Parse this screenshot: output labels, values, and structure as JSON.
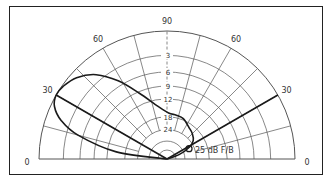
{
  "chart_data": {
    "type": "polar-elevation-pattern",
    "angle_labels": [
      {
        "angle": 0,
        "text": "0",
        "side": "left"
      },
      {
        "angle": 30,
        "text": "30",
        "side": "left"
      },
      {
        "angle": 60,
        "text": "60",
        "side": "left"
      },
      {
        "angle": 90,
        "text": "90",
        "side": "top"
      },
      {
        "angle": 60,
        "text": "60",
        "side": "right"
      },
      {
        "angle": 30,
        "text": "30",
        "side": "right"
      },
      {
        "angle": 0,
        "text": "0",
        "side": "right"
      }
    ],
    "radial_grid_angles_deg": [
      15,
      30,
      45,
      60,
      75,
      90,
      105,
      120,
      135,
      150,
      165
    ],
    "ring_labels": [
      {
        "db": -3,
        "text": "3"
      },
      {
        "db": -6,
        "text": "6"
      },
      {
        "db": -9,
        "text": "9"
      },
      {
        "db": -12,
        "text": "12"
      },
      {
        "db": -18,
        "text": "18"
      },
      {
        "db": -24,
        "text": "24"
      }
    ],
    "ring_radii_fraction": [
      1.0,
      0.81,
      0.68,
      0.57,
      0.47,
      0.33,
      0.23,
      0.14,
      0.07
    ],
    "annotation": "25 dB F/B",
    "lines": [
      {
        "from_angle_deg": 150,
        "label": "left 30° line"
      },
      {
        "from_angle_deg": 30,
        "label": "right 30° line"
      }
    ],
    "pattern_polar": [
      [
        180,
        0.0
      ],
      [
        172,
        0.4
      ],
      [
        165,
        0.72
      ],
      [
        160,
        0.88
      ],
      [
        155,
        0.97
      ],
      [
        150,
        1.0
      ],
      [
        145,
        0.99
      ],
      [
        138,
        0.95
      ],
      [
        130,
        0.86
      ],
      [
        122,
        0.72
      ],
      [
        113,
        0.56
      ],
      [
        100,
        0.42
      ],
      [
        88,
        0.36
      ],
      [
        78,
        0.35
      ],
      [
        68,
        0.34
      ],
      [
        55,
        0.3
      ],
      [
        45,
        0.28
      ],
      [
        35,
        0.25
      ],
      [
        28,
        0.2
      ],
      [
        20,
        0.1
      ],
      [
        0,
        0.0
      ]
    ],
    "colors": {
      "grid": "#555555",
      "pattern": "#1a1a1a",
      "frame": "#222222"
    }
  }
}
